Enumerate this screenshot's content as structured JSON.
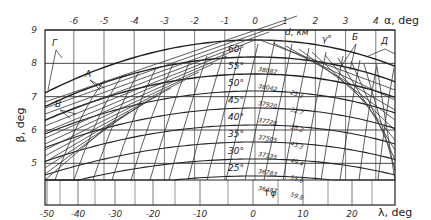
{
  "chart_data": {
    "type": "line",
    "title": "",
    "top_axis": {
      "label": "α, deg",
      "ticks": [
        -6,
        -5,
        -4,
        -3,
        -2,
        -1,
        0,
        1,
        2,
        3,
        4
      ],
      "tick_labels": [
        "-6",
        "-5",
        "-4",
        "-3",
        "-2",
        "-1",
        "0",
        "1",
        "2",
        "3",
        "4"
      ]
    },
    "bottom_axis": {
      "label": "λ, deg",
      "ticks": [
        -50,
        -40,
        -30,
        -20,
        -10,
        0,
        10,
        20
      ],
      "tick_labels": [
        "-50",
        "-40",
        "-30",
        "-20",
        "-10",
        "0",
        "10",
        "20"
      ]
    },
    "left_axis": {
      "label": "β, deg",
      "ticks": [
        5,
        6,
        7,
        8,
        9
      ],
      "tick_labels": [
        "5",
        "6",
        "7",
        "8",
        "9"
      ],
      "range": [
        4.2,
        9
      ]
    },
    "latitude_lines": [
      {
        "label": "60°",
        "altitude_km": "",
        "value": ""
      },
      {
        "label": "55°",
        "altitude_km": "38087",
        "value": ""
      },
      {
        "label": "50°",
        "altitude_km": "38042",
        "value": "23.3"
      },
      {
        "label": "45°",
        "altitude_km": "37920",
        "value": "32.7"
      },
      {
        "label": "40°",
        "altitude_km": "37728",
        "value": "38.2"
      },
      {
        "label": "35°",
        "altitude_km": "37505",
        "value": "43.3"
      },
      {
        "label": "30°",
        "altitude_km": "37135",
        "value": "49.4"
      },
      {
        "label": "25°",
        "altitude_km": "36783",
        "value": "55.6"
      },
      {
        "label": "",
        "altitude_km": "36487",
        "value": "59.8"
      }
    ],
    "annotations": {
      "d_km": "d, км",
      "gamma": "γ°",
      "phi_arrow": "↑φ",
      "A": "А",
      "B": "Б",
      "V": "В",
      "G": "Г",
      "D": "Д"
    },
    "grid": true
  }
}
